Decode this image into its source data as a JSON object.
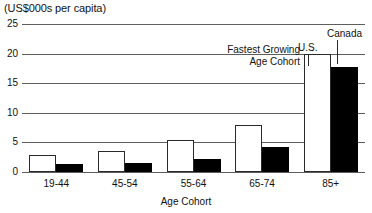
{
  "chart_data": {
    "type": "bar",
    "title": "(US$000s per capita)",
    "xlabel": "Age Cohort",
    "ylabel": "",
    "ylim": [
      0,
      25
    ],
    "yticks": [
      0,
      5,
      10,
      15,
      20,
      25
    ],
    "ytick_labels": [
      "0",
      "5",
      "10",
      "15",
      "20",
      "25"
    ],
    "grid": true,
    "legend_position": "annotated-inline",
    "categories": [
      "19-44",
      "45-54",
      "55-64",
      "65-74",
      "85+"
    ],
    "series": [
      {
        "name": "U.S.",
        "color": "#ffffff",
        "values": [
          2.8,
          3.6,
          5.4,
          8.0,
          20.0
        ]
      },
      {
        "name": "Canada",
        "color": "#000000",
        "values": [
          1.3,
          1.6,
          2.2,
          4.2,
          17.8
        ]
      }
    ],
    "annotations": [
      {
        "name": "fastest-growing",
        "text_line1": "Fastest Growing",
        "text_line2": "Age Cohort"
      },
      {
        "name": "us-label",
        "text": "U.S."
      },
      {
        "name": "canada-label",
        "text": "Canada"
      }
    ]
  },
  "labels": {
    "title": "(US$000s per capita)",
    "xaxis_title": "Age Cohort",
    "annotation_fastest_line1": "Fastest Growing",
    "annotation_fastest_line2": "Age Cohort",
    "annotation_us": "U.S.",
    "annotation_canada": "Canada"
  },
  "colors": {
    "us_bar": "#ffffff",
    "canada_bar": "#000000",
    "gridline": "#5d5d5d",
    "text": "#111111",
    "background": "#ffffff"
  }
}
